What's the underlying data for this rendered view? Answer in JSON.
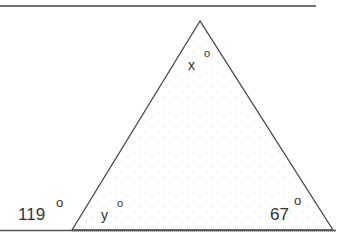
{
  "figure": {
    "type": "triangle with exterior angle",
    "labels": {
      "apex": "x",
      "bottom_left_interior": "y",
      "bottom_right_interior": "67",
      "exterior_left": "119"
    },
    "degree_symbol": "°",
    "colors": {
      "stroke": "#444444",
      "fill_dots": "#c8c8c8",
      "text": "#333333"
    }
  }
}
